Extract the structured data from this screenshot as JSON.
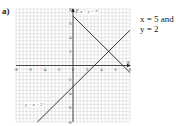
{
  "part_label": "a)",
  "answer": {
    "line1": "x = 5 and",
    "line2": "y = 2"
  },
  "chart_data": {
    "type": "line",
    "title": "",
    "xlabel": "x",
    "ylabel": "y",
    "xlim": [
      -8,
      8
    ],
    "ylim": [
      -8,
      8
    ],
    "grid": true,
    "x_ticks": [
      -8,
      -6,
      -4,
      -2,
      0,
      2,
      4,
      6,
      8
    ],
    "y_ticks": [
      -8,
      -6,
      -4,
      -2,
      2,
      4,
      6,
      8
    ],
    "series": [
      {
        "name": "x + y = 7",
        "x": [
          0,
          8
        ],
        "y": [
          7,
          -1
        ],
        "label": "x + y = 7"
      },
      {
        "name": "y = x - 3",
        "x": [
          -5,
          8
        ],
        "y": [
          -8,
          5
        ],
        "label": "y = x − 3"
      }
    ],
    "intersection": {
      "x": 5,
      "y": 2
    }
  }
}
